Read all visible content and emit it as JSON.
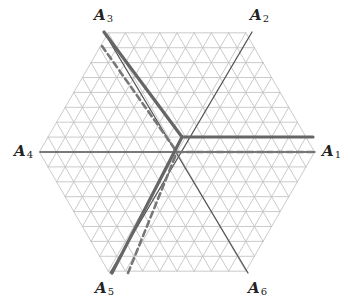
{
  "diagram": {
    "title": "",
    "geometry": {
      "center": [
        177,
        152
      ],
      "unit_px": 17.2,
      "hex_side_units": 8
    },
    "colors": {
      "grid": "#c4c4c4",
      "axis": "#555555",
      "thick_path": "#666666",
      "dashed_path": "#777777",
      "label": "#222222"
    },
    "labels": [
      {
        "id": "A1",
        "letter": "A",
        "sub": "1",
        "x": 322,
        "y": 144
      },
      {
        "id": "A2",
        "letter": "A",
        "sub": "2",
        "x": 250,
        "y": 8
      },
      {
        "id": "A3",
        "letter": "A",
        "sub": "3",
        "x": 94,
        "y": 8
      },
      {
        "id": "A4",
        "letter": "A",
        "sub": "4",
        "x": 14,
        "y": 144
      },
      {
        "id": "A5",
        "letter": "A",
        "sub": "5",
        "x": 95,
        "y": 281
      },
      {
        "id": "A6",
        "letter": "A",
        "sub": "6",
        "x": 248,
        "y": 281
      }
    ],
    "axes": [
      {
        "name": "axis-A1-A4",
        "from": [
          40,
          152
        ],
        "to": [
          315,
          152
        ]
      },
      {
        "name": "axis-A2-A5",
        "from": [
          252,
          32
        ],
        "to": [
          110,
          273
        ]
      },
      {
        "name": "axis-A3-A6",
        "from": [
          104,
          32
        ],
        "to": [
          248,
          273
        ]
      }
    ],
    "thick_paths": [
      {
        "name": "thick-path-A3-to-center",
        "points": [
          [
            104,
            32
          ],
          [
            182,
            137
          ]
        ]
      },
      {
        "name": "thick-path-center-to-A1-side",
        "points": [
          [
            182,
            137
          ],
          [
            313,
            137
          ]
        ]
      },
      {
        "name": "thick-path-A5-to-center",
        "points": [
          [
            112,
            273
          ],
          [
            182,
            137
          ]
        ]
      }
    ],
    "dashed_paths": [
      {
        "name": "dashed-path-upper",
        "points": [
          [
            102,
            46
          ],
          [
            177,
            152
          ]
        ]
      },
      {
        "name": "dashed-path-right",
        "points": [
          [
            177,
            152
          ],
          [
            315,
            152
          ]
        ]
      },
      {
        "name": "dashed-path-lower",
        "points": [
          [
            128,
            273
          ],
          [
            177,
            152
          ]
        ]
      }
    ]
  }
}
